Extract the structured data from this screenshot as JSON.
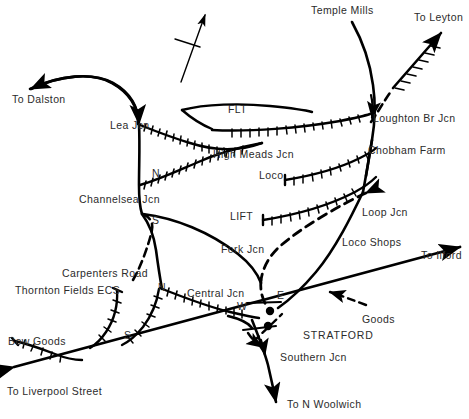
{
  "diagram": {
    "background_color": "#ffffff",
    "line_color": "#000000",
    "text_color": "#2b2b2b",
    "north_arrow": "north-arrow"
  },
  "labels": {
    "to_dalston": "To Dalston",
    "lea_jcn": "Lea Jcn",
    "channelsea_jcn": "Channelsea Jcn",
    "channelsea_n": "N",
    "channelsea_s": "S",
    "flt": "FLT",
    "high_meads_jcn": "High Meads Jcn",
    "temple_mills": "Temple Mills",
    "to_leyton": "To Leyton",
    "loughton_br_jcn": "Loughton Br Jcn",
    "chobham_farm": "Chobham Farm",
    "loco": "Loco",
    "lift": "LIFT",
    "loop_jcn": "Loop Jcn",
    "loco_shops": "Loco Shops",
    "fork_jcn": "Fork Jcn",
    "carpenters_road": "Carpenters Road",
    "thornton_fields_ecs": "Thornton Fields ECS",
    "central_jcn": "Central Jcn",
    "central_n": "N",
    "central_s": "S",
    "to_ilford": "To Ilford",
    "stratford_w": "W",
    "stratford_e": "E",
    "stratford": "STRATFORD",
    "goods": "Goods",
    "bow_goods": "Bow Goods",
    "southern_jcn": "Southern Jcn",
    "to_liverpool_street": "To Liverpool Street",
    "to_n_woolwich": "To N Woolwich"
  }
}
